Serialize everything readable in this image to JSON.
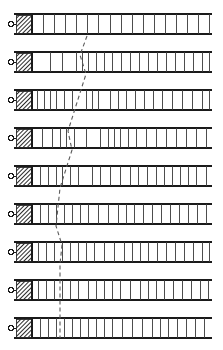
{
  "figure": {
    "background_color": "#ffffff",
    "ink_color": "#1a1a1a",
    "rung_color": "#3a3a3a",
    "hatch_color": "#2b2b2b",
    "dashed_line_color": "#5a5a5a",
    "width": 223,
    "height": 350,
    "row_count": 9,
    "ladder": {
      "left_edge_x": 14,
      "block_start_x": 16,
      "block_end_x": 32,
      "track_start_x": 32,
      "track_end_x": 212,
      "row_height": 20,
      "rail_thickness": 1.6,
      "rung_thickness": 0.9,
      "marker_shape": "circle",
      "marker_radius": 2.4,
      "marker_offset_x": 11,
      "hatch_spacing": 3
    },
    "correlation_line": {
      "name": "dashed-correlation-line",
      "style": "dashed",
      "dash_pattern": "4 3",
      "stroke_width": 1.1,
      "points": [
        [
          87,
          36
        ],
        [
          80,
          55
        ],
        [
          86,
          74
        ],
        [
          80,
          93
        ],
        [
          74,
          112
        ],
        [
          68,
          131
        ],
        [
          72,
          150
        ],
        [
          66,
          169
        ],
        [
          60,
          188
        ],
        [
          58,
          207
        ],
        [
          56,
          226
        ],
        [
          62,
          245
        ],
        [
          60,
          264
        ],
        [
          60,
          283
        ],
        [
          60,
          302
        ],
        [
          60,
          321
        ],
        [
          60,
          338
        ]
      ]
    },
    "rows": [
      {
        "index": 1,
        "label": "row-1",
        "top_y": 14,
        "rungs": [
          43,
          54,
          65,
          76,
          87,
          98,
          110,
          121,
          132,
          143,
          154,
          165,
          176,
          187,
          198,
          209
        ]
      },
      {
        "index": 2,
        "label": "row-2",
        "top_y": 52,
        "rungs": [
          50,
          62,
          76,
          82,
          88,
          96,
          104,
          112,
          121,
          130,
          139,
          148,
          157,
          166,
          175,
          184,
          193,
          202,
          209
        ]
      },
      {
        "index": 3,
        "label": "row-3",
        "top_y": 90,
        "rungs": [
          37,
          44,
          50,
          56,
          64,
          72,
          86,
          92,
          98,
          110,
          118,
          126,
          135,
          144,
          153,
          162,
          172,
          182,
          192,
          202,
          209
        ]
      },
      {
        "index": 4,
        "label": "row-4",
        "top_y": 128,
        "rungs": [
          42,
          52,
          60,
          66,
          74,
          86,
          100,
          108,
          114,
          120,
          128,
          136,
          146,
          156,
          166,
          176,
          186,
          196,
          206
        ]
      },
      {
        "index": 5,
        "label": "row-5",
        "top_y": 166,
        "rungs": [
          40,
          48,
          56,
          62,
          70,
          78,
          92,
          100,
          110,
          120,
          130,
          138,
          147,
          156,
          164,
          172,
          180,
          188,
          196,
          206
        ]
      },
      {
        "index": 6,
        "label": "row-6",
        "top_y": 204,
        "rungs": [
          40,
          48,
          56,
          64,
          72,
          80,
          88,
          98,
          108,
          118,
          126,
          134,
          143,
          152,
          161,
          170,
          179,
          188,
          197,
          206
        ]
      },
      {
        "index": 7,
        "label": "row-7",
        "top_y": 242,
        "rungs": [
          38,
          46,
          54,
          62,
          70,
          78,
          86,
          94,
          104,
          114,
          124,
          132,
          140,
          148,
          157,
          166,
          175,
          184,
          193,
          202,
          209
        ]
      },
      {
        "index": 8,
        "label": "row-8",
        "top_y": 280,
        "rungs": [
          38,
          46,
          54,
          62,
          70,
          78,
          88,
          96,
          104,
          112,
          120,
          130,
          140,
          148,
          156,
          164,
          173,
          182,
          191,
          200,
          208
        ]
      },
      {
        "index": 9,
        "label": "row-9",
        "top_y": 318,
        "rungs": [
          40,
          48,
          56,
          64,
          72,
          80,
          88,
          96,
          104,
          112,
          122,
          132,
          142,
          152,
          160,
          168,
          177,
          186,
          195,
          204
        ]
      }
    ]
  }
}
